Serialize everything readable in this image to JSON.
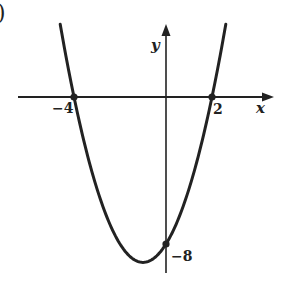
{
  "figure": {
    "corner_label": ")",
    "axis_x_label": "x",
    "axis_y_label": "y",
    "tick_labels": {
      "x_left_root": "−4",
      "x_right_root": "2",
      "y_intercept": "−8"
    },
    "colors": {
      "ink": "#222222",
      "background": "#ffffff"
    }
  },
  "chart_data": {
    "type": "line",
    "title": "",
    "xlabel": "x",
    "ylabel": "y",
    "function": "y = x^2 + 2x - 8 = (x + 4)(x - 2)",
    "series": [
      {
        "name": "parabola",
        "x": [
          -4.6,
          -4,
          -3,
          -2,
          -1,
          0,
          1,
          2,
          2.6
        ],
        "values": [
          3.96,
          0,
          -5,
          -8,
          -9,
          -8,
          -5,
          0,
          3.96
        ]
      }
    ],
    "marked_points": [
      {
        "label": "−4",
        "x": -4,
        "y": 0
      },
      {
        "label": "2",
        "x": 2,
        "y": 0
      },
      {
        "label": "−8",
        "x": 0,
        "y": -8
      }
    ],
    "vertex": {
      "x": -1,
      "y": -9
    },
    "xlim": [
      -6.5,
      4.7
    ],
    "ylim": [
      -9.5,
      3.9
    ],
    "grid": false,
    "legend": "none"
  }
}
